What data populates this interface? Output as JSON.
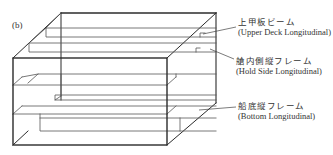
{
  "figure": {
    "panel_label": "(b)",
    "labels": [
      {
        "id": "upper-deck",
        "jp": "上甲板ビーム",
        "en": "(Upper Deck Longitudinal)"
      },
      {
        "id": "hold-side",
        "jp": "艙内側縦フレーム",
        "en": "(Hold Side Longitudinal)"
      },
      {
        "id": "bottom",
        "jp": "船底縦フレーム",
        "en": "(Bottom Longitudinal)"
      }
    ],
    "colors": {
      "line": "#2b2b2b",
      "thin_line": "#6a6a6a",
      "background": "#ffffff"
    }
  }
}
